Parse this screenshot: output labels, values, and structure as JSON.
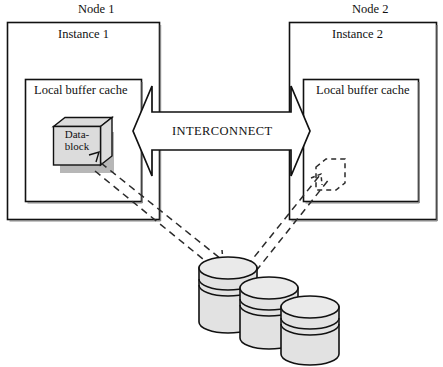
{
  "diagram": {
    "title_label": "",
    "nodes": [
      {
        "node_label": "Node 1",
        "instance_label": "Instance 1",
        "cache_label": "Local buffer cache",
        "block": {
          "line1": "Data-",
          "line2": "block",
          "state": "filled"
        }
      },
      {
        "node_label": "Node 2",
        "instance_label": "Instance 2",
        "cache_label": "Local buffer cache",
        "block": {
          "line1": "",
          "line2": "",
          "state": "dashed-empty"
        }
      }
    ],
    "interconnect": {
      "label": "INTERCONNECT",
      "direction": "bidirectional"
    },
    "storage": {
      "label": "",
      "disk_count": 3
    },
    "colors": {
      "stroke": "#111111",
      "fill_shape": "#dcdcdc",
      "fill_box": "#ffffff",
      "arrow_fill": "#ffffff",
      "dash_stroke": "#2b2b2b",
      "background": "#ffffff"
    }
  }
}
